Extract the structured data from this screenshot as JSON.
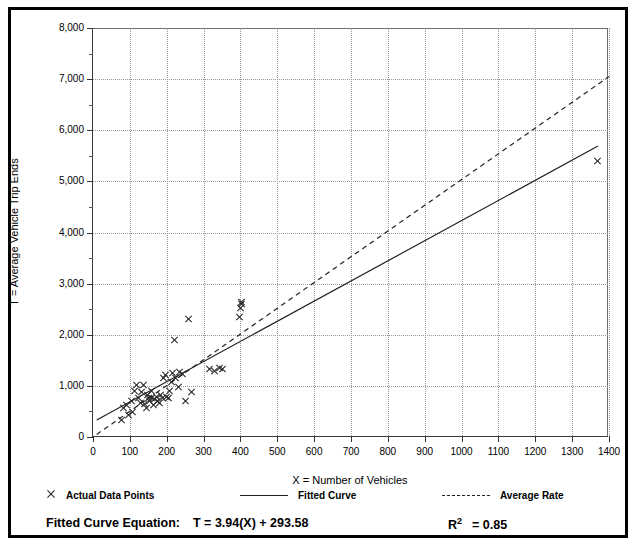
{
  "chart_data": {
    "type": "scatter",
    "title": "",
    "xlabel": "X = Number of Vehicles",
    "ylabel": "T = Average Vehicle Trip Ends",
    "xlim": [
      0,
      1400
    ],
    "ylim": [
      0,
      8000
    ],
    "xticks": [
      0,
      100,
      200,
      300,
      400,
      500,
      600,
      700,
      800,
      900,
      1000,
      1100,
      1200,
      1300,
      1400
    ],
    "xticklabels": [
      "0",
      "100",
      "200",
      "300",
      "400",
      "500",
      "600",
      "700",
      "800",
      "900",
      "1000",
      "1100",
      "1200",
      "1300",
      "1400"
    ],
    "yticks": [
      0,
      1000,
      2000,
      3000,
      4000,
      5000,
      6000,
      7000,
      8000
    ],
    "yticklabels": [
      "0",
      "1,000",
      "2,000",
      "3,000",
      "4,000",
      "5,000",
      "6,000",
      "7,000",
      "8,000"
    ],
    "y_minor_ticks": [
      500,
      1500,
      2500,
      3500,
      4500,
      5500,
      6500,
      7500
    ],
    "grid": "dotted",
    "grid_color": "#9a9a9a",
    "legend_position": "below-axes",
    "series": [
      {
        "name": "Actual Data Points",
        "type": "scatter",
        "marker": "x",
        "color": "#222222",
        "points": [
          [
            78,
            340
          ],
          [
            84,
            560
          ],
          [
            92,
            620
          ],
          [
            96,
            440
          ],
          [
            104,
            700
          ],
          [
            108,
            480
          ],
          [
            112,
            900
          ],
          [
            118,
            1010
          ],
          [
            124,
            760
          ],
          [
            128,
            660
          ],
          [
            132,
            880
          ],
          [
            136,
            1020
          ],
          [
            140,
            640
          ],
          [
            144,
            560
          ],
          [
            148,
            820
          ],
          [
            150,
            760
          ],
          [
            154,
            700
          ],
          [
            158,
            900
          ],
          [
            160,
            760
          ],
          [
            164,
            620
          ],
          [
            168,
            740
          ],
          [
            172,
            780
          ],
          [
            176,
            700
          ],
          [
            180,
            660
          ],
          [
            184,
            820
          ],
          [
            188,
            760
          ],
          [
            192,
            1150
          ],
          [
            196,
            1220
          ],
          [
            200,
            780
          ],
          [
            204,
            760
          ],
          [
            208,
            900
          ],
          [
            212,
            1080
          ],
          [
            216,
            1260
          ],
          [
            220,
            1900
          ],
          [
            224,
            1160
          ],
          [
            232,
            980
          ],
          [
            236,
            1280
          ],
          [
            244,
            1230
          ],
          [
            252,
            700
          ],
          [
            258,
            2300
          ],
          [
            268,
            880
          ],
          [
            316,
            1330
          ],
          [
            330,
            1300
          ],
          [
            344,
            1350
          ],
          [
            352,
            1330
          ],
          [
            398,
            2350
          ],
          [
            400,
            2520
          ],
          [
            402,
            2600
          ],
          [
            404,
            2640
          ],
          [
            1370,
            5400
          ]
        ]
      },
      {
        "name": "Fitted Curve",
        "type": "line",
        "style": "solid",
        "color": "#222222",
        "equation": "T = 3.94(X) + 293.58",
        "slope": 3.94,
        "intercept": 293.58,
        "r_squared": 0.85,
        "endpoints": [
          [
            10,
            333
          ],
          [
            1370,
            5691
          ]
        ]
      },
      {
        "name": "Average Rate",
        "type": "line",
        "style": "dashed",
        "color": "#222222",
        "slope": 5.04,
        "intercept": 0,
        "endpoints": [
          [
            10,
            50
          ],
          [
            1400,
            7050
          ]
        ]
      }
    ]
  },
  "axis": {
    "y_title": "T = Average Vehicle Trip Ends",
    "x_title": "X = Number of Vehicles"
  },
  "legend": {
    "items": [
      {
        "label": "Actual Data Points",
        "icon": "x-marker"
      },
      {
        "label": "Fitted Curve",
        "icon": "solid-line"
      },
      {
        "label": "Average Rate",
        "icon": "dashed-line"
      }
    ]
  },
  "footer": {
    "equation_label": "Fitted Curve Equation:",
    "equation_value": "T = 3.94(X) + 293.58",
    "r_squared_prefix": "R",
    "r_squared_exponent": "2",
    "r_squared_value": "= 0.85"
  },
  "top_crop": {
    "text": ""
  }
}
